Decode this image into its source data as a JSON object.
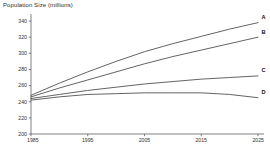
{
  "chart_data": {
    "type": "line",
    "title": "Population Size (millions)",
    "xlabel": "",
    "ylabel": "Population Size (millions)",
    "x": [
      1985,
      1990,
      1995,
      2000,
      2005,
      2010,
      2015,
      2020,
      2025
    ],
    "xlim": [
      1985,
      2025
    ],
    "ylim": [
      200,
      345
    ],
    "xticks": [
      1985,
      1995,
      2005,
      2015,
      2025
    ],
    "xtick_labels": [
      "1985",
      "1995",
      "2005",
      "2015",
      "2025"
    ],
    "yticks": [
      200,
      220,
      240,
      260,
      280,
      300,
      320,
      340
    ],
    "ytick_labels": [
      "200",
      "220",
      "240",
      "260",
      "280",
      "300",
      "320",
      "340"
    ],
    "grid": false,
    "legend_position": "right-end-labels",
    "series": [
      {
        "name": "A",
        "label": "A",
        "values": [
          248,
          263,
          277,
          290,
          302,
          312,
          321,
          330,
          338
        ]
      },
      {
        "name": "B",
        "label": "B",
        "values": [
          246,
          257,
          267,
          277,
          287,
          296,
          304,
          312,
          320
        ]
      },
      {
        "name": "C",
        "label": "C",
        "values": [
          244,
          249,
          254,
          258,
          262,
          265,
          268,
          270,
          272
        ]
      },
      {
        "name": "D",
        "label": "D",
        "values": [
          242,
          246,
          249,
          250,
          251,
          251,
          251,
          249,
          245
        ]
      }
    ]
  }
}
